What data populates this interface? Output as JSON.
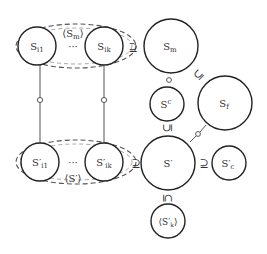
{
  "diagram": {
    "top_group": {
      "label": "⟨S_m⟩",
      "nodes": [
        {
          "id": "S_i1",
          "label": "S_i1"
        },
        {
          "id": "S_ik",
          "label": "S_ik"
        }
      ],
      "ellipsis": "···"
    },
    "bottom_group": {
      "label": "⟨S'⟩",
      "nodes": [
        {
          "id": "S'_i1",
          "label": "S'_i1"
        },
        {
          "id": "S'_ik",
          "label": "S'_ik"
        }
      ],
      "ellipsis": "···"
    },
    "nodes": [
      {
        "id": "S_m",
        "label": "S_m"
      },
      {
        "id": "S^c",
        "label": "S^c"
      },
      {
        "id": "S_f",
        "label": "S_f"
      },
      {
        "id": "S'",
        "label": "S'"
      },
      {
        "id": "S'_c",
        "label": "S'_c"
      },
      {
        "id": "⟨S'_k⟩",
        "label": "⟨S'_k⟩"
      }
    ],
    "relations": [
      {
        "from": "top_group",
        "to": "S_m",
        "symbol": "⊇"
      },
      {
        "from": "S_m",
        "to": "S^c",
        "symbol": "∘"
      },
      {
        "from": "S_m",
        "to": "S_f",
        "symbol": "⊆"
      },
      {
        "from": "S^c",
        "to": "S'",
        "symbol": "⊆"
      },
      {
        "from": "S_f",
        "to": "S'",
        "symbol": "∘"
      },
      {
        "from": "bottom_group",
        "to": "S'",
        "symbol": "⊇"
      },
      {
        "from": "S'",
        "to": "S'_c",
        "symbol": "⊇"
      },
      {
        "from": "S'",
        "to": "⟨S'_k⟩",
        "symbol": "⊆"
      },
      {
        "from": "S_i1",
        "to": "S'_i1",
        "symbol": "∘"
      },
      {
        "from": "S_ik",
        "to": "S'_ik",
        "symbol": "∘"
      }
    ],
    "symbols": {
      "supseteq": "⊇",
      "subseteq": "⊆",
      "compose": "∘"
    }
  }
}
